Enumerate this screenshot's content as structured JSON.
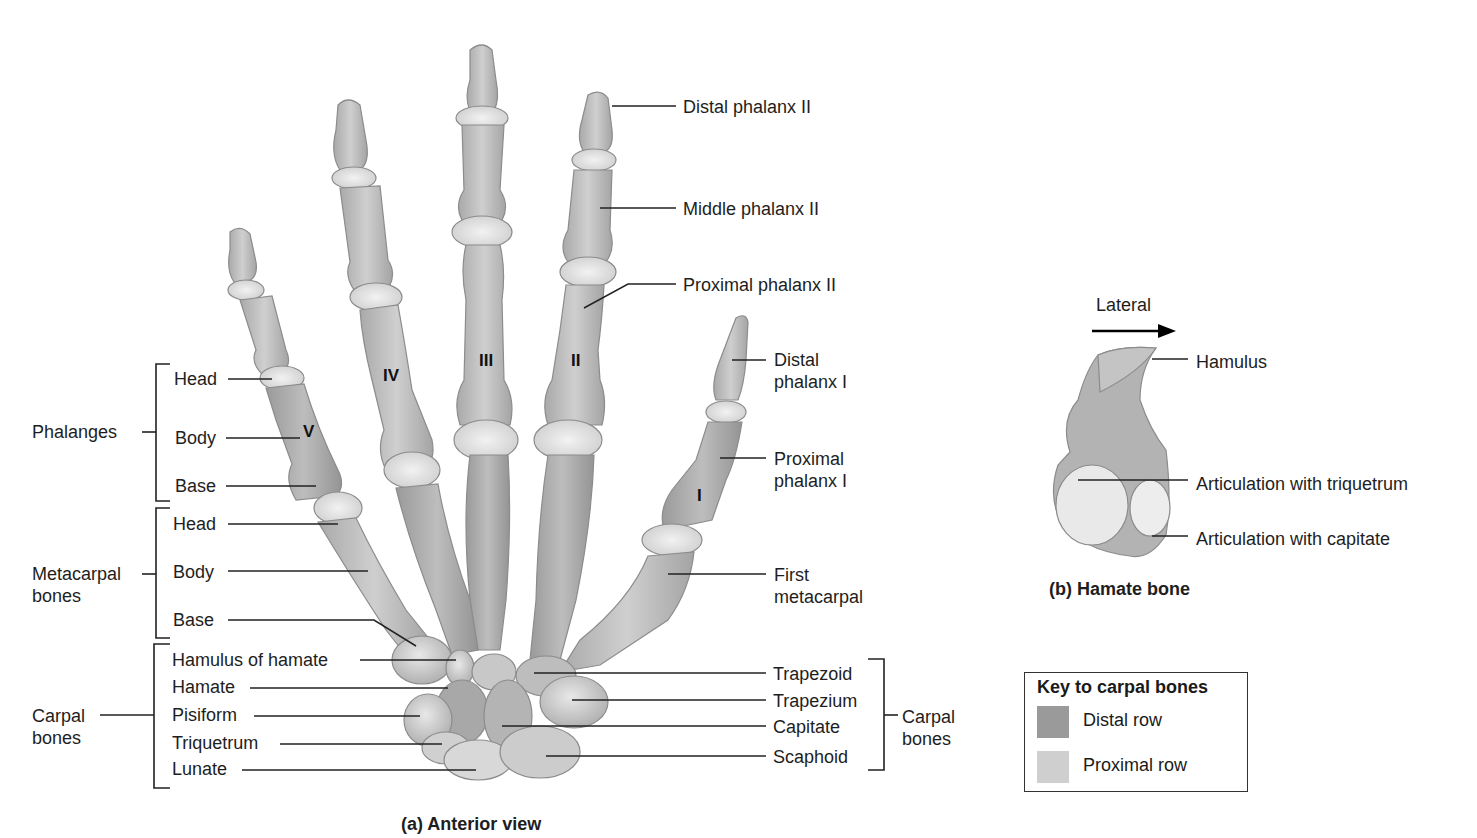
{
  "header_fragment": "inter = between + osse = bones",
  "panel_a": {
    "caption": "(a) Anterior view",
    "roman_numerals": [
      "I",
      "II",
      "III",
      "IV",
      "V"
    ],
    "left_labels": {
      "groups": {
        "phalanges": "Phalanges",
        "metacarpal": "Metacarpal bones",
        "carpal": "Carpal bones"
      },
      "phalanges_parts": [
        "Head",
        "Body",
        "Base"
      ],
      "metacarpal_parts": [
        "Head",
        "Body",
        "Base"
      ],
      "carpal_parts": [
        "Hamulus of hamate",
        "Hamate",
        "Pisiform",
        "Triquetrum",
        "Lunate"
      ]
    },
    "right_labels": {
      "distal_phalanx_ii": "Distal phalanx II",
      "middle_phalanx_ii": "Middle phalanx II",
      "proximal_phalanx_ii": "Proximal phalanx II",
      "distal_phalanx_i": "Distal phalanx I",
      "proximal_phalanx_i": "Proximal phalanx I",
      "first_metacarpal": "First metacarpal",
      "carpal_parts": [
        "Trapezoid",
        "Trapezium",
        "Capitate",
        "Scaphoid"
      ],
      "carpal_group": "Carpal bones"
    }
  },
  "panel_b": {
    "caption": "(b) Hamate bone",
    "direction_label": "Lateral",
    "labels": [
      "Hamulus",
      "Articulation with triquetrum",
      "Articulation with capitate"
    ]
  },
  "key": {
    "title": "Key to carpal bones",
    "items": [
      {
        "label": "Distal row",
        "color": "#9a9a9a"
      },
      {
        "label": "Proximal row",
        "color": "#cfcfcf"
      }
    ]
  },
  "colors": {
    "bone_shaft": "#b9b9b9",
    "bone_joint": "#e6e6e6",
    "bone_outline": "#8c8c8c",
    "line": "#222222"
  }
}
